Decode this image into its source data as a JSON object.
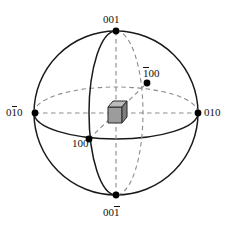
{
  "figure": {
    "type": "crystallographic-pole-sphere",
    "colors": {
      "sphere_outline": "#1a1a1a",
      "dashed_guide": "#8c8c8c",
      "pole_dot": "#000000",
      "cube_front_face": "#9a9a9a",
      "cube_top_face": "#b5b5b5",
      "cube_side_face": "#7a7a7a",
      "cube_edge": "#2b2b2b",
      "background": "#ffffff",
      "text": "#111111"
    },
    "geometry": {
      "center_x": 116,
      "center_y": 113,
      "radius": 82,
      "equator_ry": 26,
      "meridian_rx": 27
    }
  },
  "labels": {
    "top": {
      "text": "001",
      "overbar": "none",
      "pole": "[001]"
    },
    "bottom": {
      "pre": "00",
      "bar": "1",
      "text": "001",
      "overbar": "last",
      "pole": "[00-1]"
    },
    "left": {
      "pre": "0",
      "bar": "1",
      "post": "0",
      "text": "010",
      "overbar": "middle",
      "pole": "[0-10]"
    },
    "right": {
      "text": "010",
      "overbar": "none",
      "pole": "[010]"
    },
    "back": {
      "bar": "1",
      "post": "00",
      "text": "100",
      "overbar": "first",
      "pole": "[-100]"
    },
    "front": {
      "text": "100",
      "overbar": "none",
      "pole": "[100]"
    }
  },
  "poles": [
    {
      "name": "top-pole",
      "label": "001",
      "x": 116,
      "y": 31
    },
    {
      "name": "bottom-pole",
      "label": "001",
      "x": 116,
      "y": 195
    },
    {
      "name": "left-pole",
      "label": "010",
      "x": 35,
      "y": 113
    },
    {
      "name": "right-pole",
      "label": "010",
      "x": 198,
      "y": 113
    },
    {
      "name": "back-pole",
      "label": "100",
      "x": 147,
      "y": 83
    },
    {
      "name": "front-pole",
      "label": "100",
      "x": 89,
      "y": 139
    }
  ],
  "unit_cell": {
    "name": "cubic-unit-cell",
    "x": 109,
    "y": 102,
    "size": 18
  }
}
